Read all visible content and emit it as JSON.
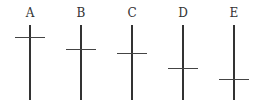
{
  "figure": {
    "crosses": [
      {
        "label": "A",
        "x": 30,
        "crossbar_y": 37
      },
      {
        "label": "B",
        "x": 81,
        "crossbar_y": 49
      },
      {
        "label": "C",
        "x": 132,
        "crossbar_y": 53
      },
      {
        "label": "D",
        "x": 183,
        "crossbar_y": 68
      },
      {
        "label": "E",
        "x": 234,
        "crossbar_y": 79
      }
    ],
    "vertical_top": 25,
    "vertical_bottom": 100,
    "line_color": "#333333"
  }
}
